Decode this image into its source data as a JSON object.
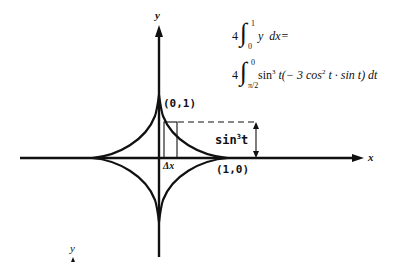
{
  "figure": {
    "type": "astroid area integral diagram",
    "axes": {
      "x_label": "x",
      "y_label": "y",
      "stray_y_label": "y"
    },
    "points": {
      "top_cusp": "(0,1)",
      "right_cusp": "(1,0)"
    },
    "annotations": {
      "strip_width": "Δx",
      "strip_height_base": "sin",
      "strip_height_exp": "3",
      "strip_height_var": "t"
    },
    "equations": {
      "line1": {
        "coef": "4",
        "upper": "1",
        "lower": "0",
        "integrand": "y  dx="
      },
      "line2": {
        "coef": "4",
        "upper": "0",
        "lower": "π/2",
        "integrand_a": "sin",
        "exp_a": "3",
        "integrand_b": " t(− 3 cos",
        "exp_b": "2",
        "integrand_c": " t · sin t) dt"
      }
    },
    "colors": {
      "ink": "#111111",
      "background": "#ffffff"
    }
  }
}
